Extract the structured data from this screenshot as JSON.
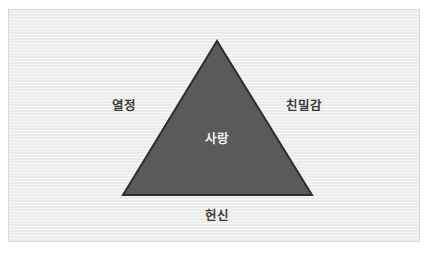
{
  "diagram": {
    "type": "triangle-concept",
    "title": "",
    "shape": {
      "name": "love-triangle",
      "fill_color": "#5a5a5a",
      "stroke_color": "#2e2e2e",
      "apex": {
        "x": 208,
        "y": 31
      },
      "bottom_left": {
        "x": 114,
        "y": 185
      },
      "bottom_right": {
        "x": 303,
        "y": 185
      }
    },
    "panel": {
      "background_color": "#eeeeee",
      "border_color": "#d8d8d8"
    },
    "labels": {
      "left": "열정",
      "right": "친밀감",
      "center": "사랑",
      "bottom": "헌신"
    },
    "label_colors": {
      "outer": "#3a3a3a",
      "inner": "#f2f2f2"
    }
  }
}
